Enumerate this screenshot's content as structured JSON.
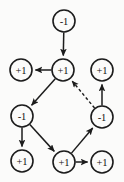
{
  "diagram": {
    "type": "directed-graph",
    "canvas": {
      "width": 124,
      "height": 182
    },
    "style": {
      "background": "#fbfbfa",
      "node_fill": "#fbfbfa",
      "node_stroke": "#1c1c1c",
      "edge_color": "#1c1c1c",
      "label_color": "#111111",
      "node_radius": 11
    },
    "nodes": [
      {
        "id": "n1",
        "label": "-1",
        "x": 64,
        "y": 21,
        "name": "node-top-minus1"
      },
      {
        "id": "n2",
        "label": "+1",
        "x": 21,
        "y": 70,
        "name": "node-row2-left-plus1"
      },
      {
        "id": "n3",
        "label": "+1",
        "x": 63,
        "y": 70,
        "name": "node-row2-center-plus1"
      },
      {
        "id": "n4",
        "label": "+1",
        "x": 102,
        "y": 70,
        "name": "node-row2-right-plus1"
      },
      {
        "id": "n5",
        "label": "-1",
        "x": 22,
        "y": 116,
        "name": "node-row3-left-minus1"
      },
      {
        "id": "n6",
        "label": "-1",
        "x": 102,
        "y": 117,
        "name": "node-row3-right-minus1"
      },
      {
        "id": "n7",
        "label": "+1",
        "x": 22,
        "y": 161,
        "name": "node-bottom-left-plus1"
      },
      {
        "id": "n8",
        "label": "+1",
        "x": 64,
        "y": 162,
        "name": "node-bottom-center-plus1"
      },
      {
        "id": "n9",
        "label": "+1",
        "x": 102,
        "y": 162,
        "name": "node-bottom-right-plus1"
      }
    ],
    "edges": [
      {
        "id": "e1",
        "from": "n1",
        "to": "n3",
        "style": "solid",
        "arrow": "to",
        "name": "edge-top-minus1-to-center-plus1"
      },
      {
        "id": "e2",
        "from": "n3",
        "to": "n2",
        "style": "solid",
        "arrow": "to",
        "name": "edge-center-plus1-to-left-plus1"
      },
      {
        "id": "e3",
        "from": "n3",
        "to": "n5",
        "style": "solid",
        "arrow": "to",
        "name": "edge-center-plus1-to-left-minus1"
      },
      {
        "id": "e4",
        "from": "n5",
        "to": "n7",
        "style": "solid",
        "arrow": "to",
        "name": "edge-left-minus1-to-bottom-left-plus1"
      },
      {
        "id": "e5",
        "from": "n5",
        "to": "n8",
        "style": "solid",
        "arrow": "to",
        "name": "edge-left-minus1-to-bottom-center-plus1"
      },
      {
        "id": "e6",
        "from": "n8",
        "to": "n9",
        "style": "solid",
        "arrow": "to",
        "name": "edge-bottom-center-plus1-to-bottom-right-plus1"
      },
      {
        "id": "e7",
        "from": "n8",
        "to": "n6",
        "style": "solid",
        "arrow": "to",
        "name": "edge-bottom-center-plus1-to-right-minus1"
      },
      {
        "id": "e8",
        "from": "n6",
        "to": "n4",
        "style": "solid",
        "arrow": "to",
        "name": "edge-right-minus1-to-right-plus1"
      },
      {
        "id": "e9",
        "from": "n6",
        "to": "n3",
        "style": "dashed",
        "arrow": "to",
        "name": "edge-right-minus1-to-center-plus1-dashed"
      }
    ]
  }
}
